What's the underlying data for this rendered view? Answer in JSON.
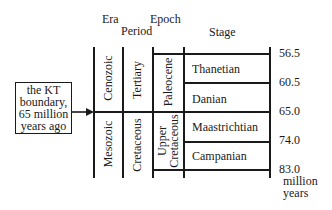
{
  "headers": {
    "era": "Era",
    "period": "Period",
    "epoch": "Epoch",
    "stage": "Stage"
  },
  "annotation": {
    "lines": [
      "the KT",
      "boundary,",
      "65 million",
      "years ago"
    ]
  },
  "eras": [
    {
      "label": "Cenozoic"
    },
    {
      "label": "Mesozoic"
    }
  ],
  "periods": [
    {
      "label": "Tertiary"
    },
    {
      "label": "Cretaceous"
    }
  ],
  "epochs": [
    {
      "label": "Paleocene"
    },
    {
      "label_line1": "Upper",
      "label_line2": "Cretaceous"
    }
  ],
  "stages": [
    {
      "label": "Thanetian"
    },
    {
      "label": "Danian"
    },
    {
      "label": "Maastrichtian"
    },
    {
      "label": "Campanian"
    }
  ],
  "ages": [
    "56.5",
    "60.5",
    "65.0",
    "74.0",
    "83.0"
  ],
  "age_unit": {
    "line1": "million",
    "line2": "years"
  },
  "colors": {
    "ink": "#1a1a1a",
    "background": "#ffffff"
  }
}
